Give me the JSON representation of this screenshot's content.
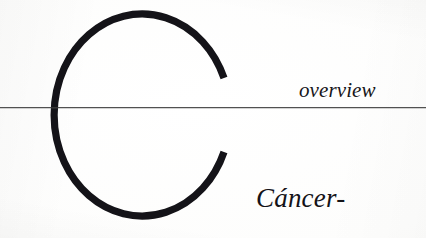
{
  "page": {
    "background_color": "#fdfdfc",
    "ink_color": "#17161a",
    "width": 426,
    "height": 238
  },
  "dropcap": {
    "letter": "C",
    "role": "decorative-initial",
    "color": "#141318",
    "description": "large open circular C"
  },
  "rule": {
    "color": "#3a3a3a",
    "role": "horizontal-divider"
  },
  "running_head": {
    "text": "overview"
  },
  "headword": {
    "text": "Cáncer-"
  }
}
